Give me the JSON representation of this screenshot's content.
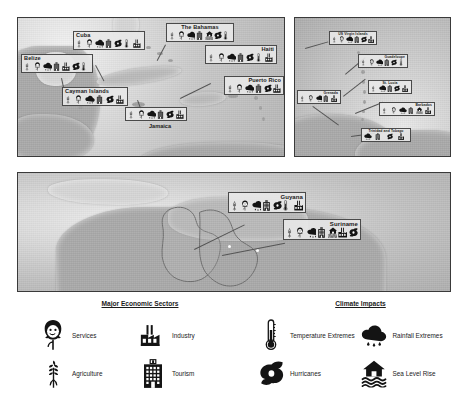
{
  "panels": [
    {
      "id": "caribbean",
      "name": "caribbean-panel",
      "labels": [
        {
          "country": "Belize",
          "icons": [
            "agriculture",
            "services",
            "rainfall",
            "tourism",
            "industry",
            "hurricane",
            "temperature"
          ]
        },
        {
          "country": "Cuba",
          "icons": [
            "agriculture",
            "services",
            "rainfall",
            "tourism",
            "hurricane",
            "temperature",
            "industry"
          ]
        },
        {
          "country": "The Bahamas",
          "icons": [
            "agriculture",
            "services",
            "rainfall",
            "tourism",
            "sealevel",
            "hurricane",
            "temperature"
          ]
        },
        {
          "country": "Haiti",
          "icons": [
            "agriculture",
            "services",
            "rainfall",
            "tourism",
            "hurricane",
            "temperature",
            "industry"
          ]
        },
        {
          "country": "Puerto Rico",
          "icons": [
            "agriculture",
            "services",
            "rainfall",
            "tourism",
            "hurricane",
            "industry"
          ]
        },
        {
          "country": "Cayman Islands",
          "icons": [
            "agriculture",
            "services",
            "rainfall",
            "tourism",
            "hurricane",
            "industry"
          ]
        },
        {
          "country": "Jamaica",
          "icons": [
            "agriculture",
            "services",
            "rainfall",
            "tourism",
            "hurricane",
            "industry"
          ]
        }
      ]
    },
    {
      "id": "antilles",
      "name": "lesser-antilles-panel",
      "labels": [
        {
          "country": "US Virgin Islands",
          "icons": [
            "agriculture",
            "services",
            "rainfall",
            "tourism",
            "hurricane",
            "industry"
          ]
        },
        {
          "country": "Guadeloupe",
          "icons": [
            "agriculture",
            "services",
            "rainfall",
            "tourism",
            "hurricane",
            "temperature"
          ]
        },
        {
          "country": "St. Lucia",
          "icons": [
            "agriculture",
            "rainfall",
            "tourism",
            "hurricane",
            "industry"
          ]
        },
        {
          "country": "Barbados",
          "icons": [
            "agriculture",
            "services",
            "rainfall",
            "tourism",
            "sealevel",
            "industry"
          ]
        },
        {
          "country": "Grenada",
          "icons": [
            "agriculture",
            "services",
            "rainfall",
            "tourism",
            "industry"
          ]
        },
        {
          "country": "Trinidad and Tobago",
          "icons": [
            "rainfall",
            "tourism",
            "hurricane",
            "industry"
          ]
        }
      ]
    },
    {
      "id": "southamerica",
      "name": "northern-south-america-panel",
      "labels": [
        {
          "country": "Guyana",
          "icons": [
            "agriculture",
            "services",
            "rainfall",
            "tourism",
            "hurricane",
            "temperature",
            "industry"
          ]
        },
        {
          "country": "Suriname",
          "icons": [
            "agriculture",
            "services",
            "rainfall",
            "tourism",
            "sealevel",
            "industry",
            "hurricane"
          ]
        }
      ]
    }
  ],
  "legend": {
    "sectors": {
      "title": "Major Economic Sectors",
      "items": [
        {
          "icon": "services-icon",
          "label": "Services"
        },
        {
          "icon": "industry-icon",
          "label": "Industry"
        },
        {
          "icon": "agriculture-icon",
          "label": "Agriculture"
        },
        {
          "icon": "tourism-icon",
          "label": "Tourism"
        }
      ]
    },
    "climate": {
      "title": "Climate Impacts",
      "items": [
        {
          "icon": "temperature-icon",
          "label": "Temperature Extremes"
        },
        {
          "icon": "rainfall-icon",
          "label": "Rainfall Extremes"
        },
        {
          "icon": "hurricane-icon",
          "label": "Hurricanes"
        },
        {
          "icon": "sealevel-icon",
          "label": "Sea Level Rise"
        }
      ]
    }
  },
  "colors": {
    "panel_border": "#3a3a3a",
    "label_box_fill": "#e8e8e8",
    "label_box_border": "#4a4a4a",
    "text": "#1b1b1b",
    "icon": "#141414",
    "leader_line": "#555555"
  }
}
